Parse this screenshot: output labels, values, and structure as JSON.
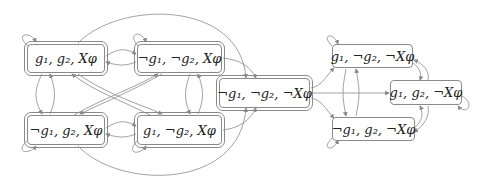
{
  "diagram": {
    "type": "state-transition-graph",
    "edge_color": "#8a8a8a",
    "nodes": [
      {
        "id": "A",
        "label": "g₁, g₂, Xφ",
        "double": true
      },
      {
        "id": "B",
        "label": "¬g₁, ¬g₂, Xφ",
        "double": true
      },
      {
        "id": "C",
        "label": "¬g₁, g₂, Xφ",
        "double": true
      },
      {
        "id": "D",
        "label": "g₁, ¬g₂, Xφ",
        "double": true
      },
      {
        "id": "E",
        "label": "¬g₁, ¬g₂, ¬Xφ",
        "double": true
      },
      {
        "id": "F",
        "label": "g₁, ¬g₂, ¬Xφ",
        "double": false
      },
      {
        "id": "G",
        "label": "g₁, g₂, ¬Xφ",
        "double": false
      },
      {
        "id": "H",
        "label": "¬g₁, g₂, ¬Xφ",
        "double": false
      }
    ],
    "edges": [
      [
        "A",
        "A"
      ],
      [
        "B",
        "B"
      ],
      [
        "C",
        "C"
      ],
      [
        "D",
        "D"
      ],
      [
        "F",
        "F"
      ],
      [
        "G",
        "G"
      ],
      [
        "H",
        "H"
      ],
      [
        "A",
        "B"
      ],
      [
        "B",
        "A"
      ],
      [
        "A",
        "C"
      ],
      [
        "C",
        "A"
      ],
      [
        "B",
        "D"
      ],
      [
        "D",
        "B"
      ],
      [
        "C",
        "D"
      ],
      [
        "D",
        "C"
      ],
      [
        "A",
        "D"
      ],
      [
        "D",
        "A"
      ],
      [
        "B",
        "C"
      ],
      [
        "C",
        "B"
      ],
      [
        "A",
        "E"
      ],
      [
        "B",
        "E"
      ],
      [
        "C",
        "E"
      ],
      [
        "D",
        "E"
      ],
      [
        "E",
        "F"
      ],
      [
        "E",
        "G"
      ],
      [
        "E",
        "H"
      ],
      [
        "F",
        "H"
      ],
      [
        "H",
        "F"
      ],
      [
        "F",
        "G"
      ],
      [
        "G",
        "F"
      ],
      [
        "H",
        "G"
      ],
      [
        "G",
        "H"
      ]
    ]
  }
}
